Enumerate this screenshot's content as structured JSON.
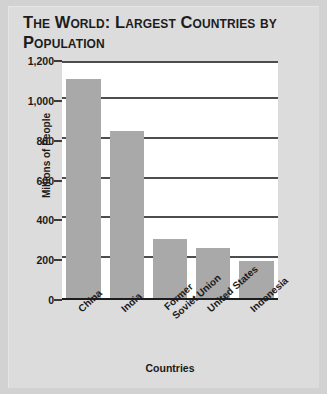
{
  "chart_data": {
    "type": "bar",
    "title": "The World: Largest Countries by Population",
    "xlabel": "Countries",
    "ylabel": "Millions of People",
    "categories": [
      "China",
      "India",
      "Former Soviet Union",
      "United States",
      "Indonesia"
    ],
    "category_lines": [
      [
        "China"
      ],
      [
        "India"
      ],
      [
        "Former",
        "Soviet Union"
      ],
      [
        "United States"
      ],
      [
        "Indonesia"
      ]
    ],
    "values": [
      1100,
      840,
      295,
      250,
      185
    ],
    "ylim": [
      0,
      1200
    ],
    "ytick_values": [
      0,
      200,
      400,
      600,
      800,
      1000,
      1200
    ],
    "ytick_labels": [
      "0",
      "200",
      "400",
      "600",
      "800",
      "1,000",
      "1,200"
    ],
    "grid": true,
    "legend": "none",
    "bar_color": "#a9a9a9",
    "plot_background": "#ffffff",
    "figure_background": "#dcdcdc",
    "axis_color": "#1d1d1d",
    "text_color": "#1a1a1a"
  }
}
